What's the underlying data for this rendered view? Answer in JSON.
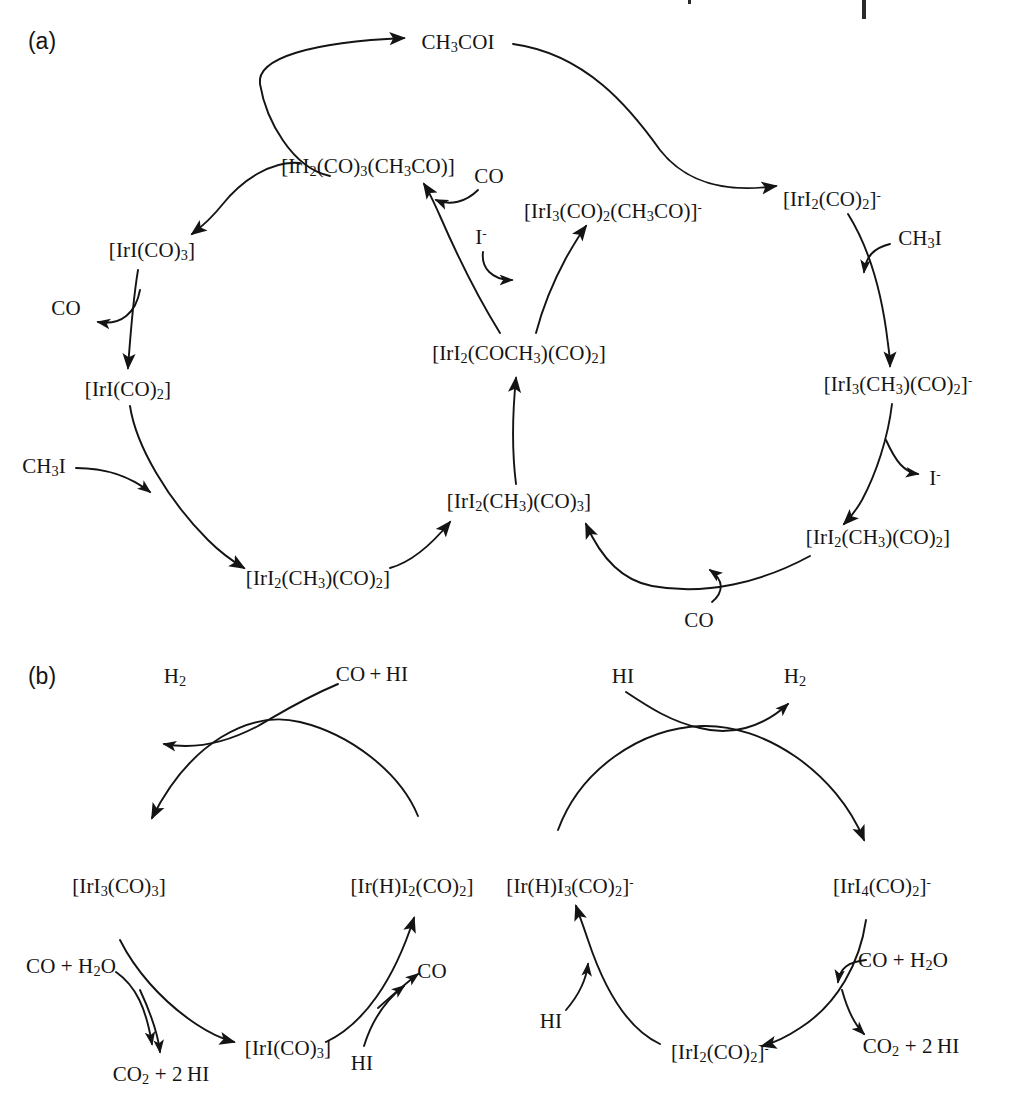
{
  "figure": {
    "type": "diagram",
    "background_color": "#ffffff",
    "ink_color": "#141414"
  },
  "panels": [
    {
      "id": "a",
      "tag": "(a)",
      "x": 42,
      "y": 41
    },
    {
      "id": "b",
      "tag": "(b)",
      "x": 42,
      "y": 676
    }
  ],
  "panel_a": {
    "species": [
      {
        "name": "acetyl-iodide-product",
        "text": "CH₃COI",
        "html": "CH<sub>3</sub>COI",
        "x": 458,
        "y": 42
      },
      {
        "name": "neutral-acyl-tricarbonyl",
        "text": "[IrI₂(CO)₃(CH₃CO)]",
        "html": "[IrI<sub>2</sub>(CO)<sub>3</sub>(CH<sub>3</sub>CO)]",
        "x": 368,
        "y": 166
      },
      {
        "name": "co-reagent-upper-center",
        "text": "CO",
        "html": "CO",
        "x": 489,
        "y": 176
      },
      {
        "name": "anionic-acyl-dicarbonyl",
        "text": "[IrI₃(CO)₂(CH₃CO)]⁻",
        "html": "[IrI<sub>3</sub>(CO)<sub>2</sub>(CH<sub>3</sub>CO)]<sup>-</sup>",
        "x": 613,
        "y": 211
      },
      {
        "name": "iodide-reagent-center",
        "text": "I⁻",
        "html": "I<sup>-</sup>",
        "x": 481,
        "y": 237
      },
      {
        "name": "anionic-dicarbonyl",
        "text": "[IrI₂(CO)₂]⁻",
        "html": "[IrI<sub>2</sub>(CO)<sub>2</sub>]<sup>-</sup>",
        "x": 832,
        "y": 199
      },
      {
        "name": "neutral-iridium-tricarbonyl",
        "text": "[IrI(CO)₃]",
        "html": "[IrI(CO)<sub>3</sub>]",
        "x": 152,
        "y": 250
      },
      {
        "name": "methyl-iodide-right",
        "text": "CH₃I",
        "html": "CH<sub>3</sub>I",
        "x": 920,
        "y": 238
      },
      {
        "name": "co-released-left",
        "text": "CO",
        "html": "CO",
        "x": 66,
        "y": 308
      },
      {
        "name": "acyl-dicarbonyl-hub",
        "text": "[IrI₂(COCH₃)(CO)₂]",
        "html": "[IrI<sub>2</sub>(COCH<sub>3</sub>)(CO)<sub>2</sub>]",
        "x": 519,
        "y": 353
      },
      {
        "name": "neutral-iridium-dicarbonyl",
        "text": "[IrI(CO)₂]",
        "html": "[IrI(CO)<sub>2</sub>]",
        "x": 128,
        "y": 389
      },
      {
        "name": "anionic-methyl-tricarbonyl",
        "text": "[IrI₃(CH₃)(CO)₂]⁻",
        "html": "[IrI<sub>3</sub>(CH<sub>3</sub>)(CO)<sub>2</sub>]<sup>-</sup>",
        "x": 898,
        "y": 384
      },
      {
        "name": "methyl-iodide-left",
        "text": "CH₃I",
        "html": "CH<sub>3</sub>I",
        "x": 44,
        "y": 466
      },
      {
        "name": "iodide-released-right",
        "text": "I⁻",
        "html": "I<sup>-</sup>",
        "x": 935,
        "y": 478
      },
      {
        "name": "neutral-methyl-tricarbonyl",
        "text": "[IrI₂(CH₃)(CO)₃]",
        "html": "[IrI<sub>2</sub>(CH<sub>3</sub>)(CO)<sub>3</sub>]",
        "x": 519,
        "y": 501
      },
      {
        "name": "neutral-methyl-dicarbonyl-right",
        "text": "[IrI₂(CH₃)(CO)₂]",
        "html": "[IrI<sub>2</sub>(CH<sub>3</sub>)(CO)<sub>2</sub>]",
        "x": 878,
        "y": 537
      },
      {
        "name": "neutral-methyl-dicarbonyl-left",
        "text": "[IrI₂(CH₃)(CO)₂]",
        "html": "[IrI<sub>2</sub>(CH<sub>3</sub>)(CO)<sub>2</sub>]",
        "x": 318,
        "y": 578
      },
      {
        "name": "co-reagent-bottom-right",
        "text": "CO",
        "html": "CO",
        "x": 699,
        "y": 620
      }
    ]
  },
  "panel_b": {
    "cycle_left": {
      "species": [
        {
          "name": "dihydrogen-product-left",
          "text": "H₂",
          "html": "H<sub>2</sub>",
          "x": 175,
          "y": 676
        },
        {
          "name": "co-plus-hi-left",
          "text": "CO + HI",
          "html": "CO&#8201;+&#8201;HI",
          "x": 372,
          "y": 674
        },
        {
          "name": "triiodo-tricarbonyl",
          "text": "[IrI₃(CO)₃]",
          "html": "[IrI<sub>3</sub>(CO)<sub>3</sub>]",
          "x": 119,
          "y": 886
        },
        {
          "name": "hydrido-diiodo-dicarbonyl",
          "text": "[Ir(H)I₂(CO)₂]",
          "html": "[Ir(H)I<sub>2</sub>(CO)<sub>2</sub>]",
          "x": 412,
          "y": 886
        },
        {
          "name": "co-plus-water-left",
          "text": "CO + H₂O",
          "html": "CO&nbsp;+&nbsp;H<sub>2</sub>O",
          "x": 71,
          "y": 966
        },
        {
          "name": "co-released-b-left",
          "text": "CO",
          "html": "CO",
          "x": 432,
          "y": 971
        },
        {
          "name": "iridium-tricarbonyl-b",
          "text": "[IrI(CO)₃]",
          "html": "[IrI(CO)<sub>3</sub>]",
          "x": 288,
          "y": 1048
        },
        {
          "name": "hydrogen-iodide-b-left",
          "text": "HI",
          "html": "HI",
          "x": 362,
          "y": 1063
        },
        {
          "name": "carbon-dioxide-plus-hi-left",
          "text": "CO₂ + 2 HI",
          "html": "CO<sub>2</sub>&nbsp;+&nbsp;2&#8201;HI",
          "x": 161,
          "y": 1074
        }
      ]
    },
    "cycle_right": {
      "species": [
        {
          "name": "hydrogen-iodide-right-top",
          "text": "HI",
          "html": "HI",
          "x": 623,
          "y": 676
        },
        {
          "name": "dihydrogen-product-right",
          "text": "H₂",
          "html": "H<sub>2</sub>",
          "x": 795,
          "y": 676
        },
        {
          "name": "hydrido-triiodo-dicarbonyl",
          "text": "[Ir(H)I₃(CO)₂]⁻",
          "html": "[Ir(H)I<sub>3</sub>(CO)<sub>2</sub>]<sup>-</sup>",
          "x": 570,
          "y": 886
        },
        {
          "name": "tetraiodo-dicarbonyl",
          "text": "[IrI₄(CO)₂]⁻",
          "html": "[IrI<sub>4</sub>(CO)<sub>2</sub>]<sup>-</sup>",
          "x": 882,
          "y": 886
        },
        {
          "name": "co-plus-water-right",
          "text": "CO + H₂O",
          "html": "CO&nbsp;+&nbsp;H<sub>2</sub>O",
          "x": 903,
          "y": 960
        },
        {
          "name": "hydrogen-iodide-b-right",
          "text": "HI",
          "html": "HI",
          "x": 551,
          "y": 1021
        },
        {
          "name": "anionic-diiodo-dicarbonyl-b",
          "text": "[IrI₂(CO)₂]⁻",
          "html": "[IrI<sub>2</sub>(CO)<sub>2</sub>]<sup>-</sup>",
          "x": 720,
          "y": 1052
        },
        {
          "name": "carbon-dioxide-plus-hi-right",
          "text": "CO₂ + 2 HI",
          "html": "CO<sub>2</sub>&nbsp;+&nbsp;2&#8201;HI",
          "x": 911,
          "y": 1046
        }
      ]
    }
  },
  "scan_artifacts": [
    {
      "name": "scan-artifact-tick",
      "x": 688,
      "y": 0,
      "w": 3,
      "h": 4
    },
    {
      "name": "scan-artifact-bar",
      "x": 862,
      "y": 0,
      "w": 4,
      "h": 19
    }
  ]
}
